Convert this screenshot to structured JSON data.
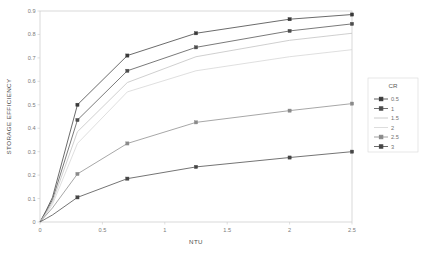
{
  "chart_data": {
    "type": "line",
    "title": "",
    "xlabel": "NTU",
    "ylabel": "STORAGE EFFICIENCY",
    "xlim": [
      0,
      2.5
    ],
    "ylim": [
      0,
      0.9
    ],
    "grid": false,
    "legend_position": "right",
    "legend_title": "CR",
    "x_ticks": [
      "0",
      "0.5",
      "1",
      "1.5",
      "2",
      "2.5"
    ],
    "x_tick_values": [
      0,
      0.5,
      1,
      1.5,
      2,
      2.5
    ],
    "y_ticks": [
      "0",
      "0.1",
      "0.2",
      "0.3",
      "0.4",
      "0.5",
      "0.6",
      "0.7",
      "0.8",
      "0.9"
    ],
    "y_tick_values": [
      0,
      0.1,
      0.2,
      0.3,
      0.4,
      0.5,
      0.6,
      0.7,
      0.8,
      0.9
    ],
    "x": [
      0,
      0.05,
      0.1,
      0.3,
      0.7,
      1.25,
      2.0,
      2.5
    ],
    "series": [
      {
        "name": "0.5",
        "color": "#3a3a3a",
        "marker": "square",
        "values": [
          0.0,
          0.05,
          0.105,
          0.5,
          0.71,
          0.805,
          0.865,
          0.885
        ]
      },
      {
        "name": "1",
        "color": "#4d4d4d",
        "marker": "square",
        "values": [
          0.0,
          0.045,
          0.095,
          0.435,
          0.645,
          0.745,
          0.815,
          0.845
        ]
      },
      {
        "name": "1.5",
        "color": "#bfbfbf",
        "marker": "none",
        "values": [
          0.0,
          0.04,
          0.085,
          0.385,
          0.595,
          0.705,
          0.775,
          0.805
        ]
      },
      {
        "name": "2",
        "color": "#d4d4d4",
        "marker": "none",
        "values": [
          0.0,
          0.035,
          0.075,
          0.335,
          0.555,
          0.645,
          0.705,
          0.735
        ]
      },
      {
        "name": "2.5",
        "color": "#8a8a8a",
        "marker": "square",
        "values": [
          0.0,
          0.03,
          0.06,
          0.205,
          0.335,
          0.425,
          0.475,
          0.505
        ]
      },
      {
        "name": "3",
        "color": "#454545",
        "marker": "square",
        "values": [
          0.0,
          0.015,
          0.03,
          0.105,
          0.185,
          0.235,
          0.275,
          0.3
        ]
      }
    ]
  },
  "axes": {
    "x_title": "NTU",
    "y_title": "STORAGE EFFICIENCY"
  },
  "legend": {
    "title": "CR",
    "entries": [
      {
        "label": "0.5"
      },
      {
        "label": "1"
      },
      {
        "label": "1.5"
      },
      {
        "label": "2"
      },
      {
        "label": "2.5"
      },
      {
        "label": "3"
      }
    ]
  }
}
